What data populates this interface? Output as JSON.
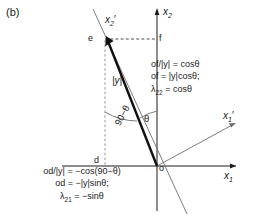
{
  "figure": {
    "panel_tag": "(b)",
    "background_color": "#ffffff",
    "ink_color": "#1a1a1a",
    "axes": {
      "x1_label": "x",
      "x1_sub": "1",
      "x2_label": "x",
      "x2_sub": "2",
      "x1_prime_label": "x",
      "x1_prime_sub": "1",
      "x1_prime_mark": "′",
      "x2_prime_label": "x",
      "x2_prime_sub": "2",
      "x2_prime_mark": "′"
    },
    "points": {
      "origin": "o",
      "vector_tip": "e",
      "projection_x2": "f",
      "projection_x1": "d"
    },
    "vector_label": "|y|",
    "angles": {
      "theta": "θ",
      "complement": "90−θ"
    },
    "equations": {
      "right_block": [
        "of/|y| = cosθ",
        "of = |y|cosθ;",
        "λ₂₂ = cosθ"
      ],
      "right_block_parts": [
        {
          "lead": "of/|y| = cosθ"
        },
        {
          "lead": "of = |y|cosθ;"
        },
        {
          "sym": "λ",
          "sub": "22",
          "tail": " = cosθ"
        }
      ],
      "bottom_block": [
        "od/|y| = −cos(90−θ)",
        "od = −|y|sinθ;",
        "λ₂₁ = −sinθ"
      ],
      "bottom_block_parts": [
        {
          "lead": "od/|y| = −cos(90−θ)"
        },
        {
          "lead": "od = −|y|sinθ;"
        },
        {
          "sym": "λ",
          "sub": "21",
          "tail": " = −sinθ"
        }
      ]
    }
  }
}
